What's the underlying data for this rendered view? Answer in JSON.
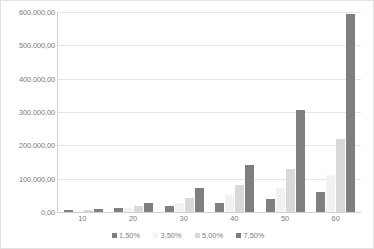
{
  "chart_data": {
    "type": "bar",
    "title": "",
    "subtitle": "",
    "xlabel": "",
    "ylabel": "",
    "grid": true,
    "legend_position": "bottom",
    "number_format": "european",
    "categories": [
      "10",
      "20",
      "30",
      "40",
      "50",
      "60"
    ],
    "ylim": [
      0,
      600000
    ],
    "ytick_values": [
      0,
      100000,
      200000,
      300000,
      400000,
      500000,
      600000
    ],
    "ytick_labels": [
      "0,00",
      "100.000,00",
      "200.000,00",
      "300.000,00",
      "400.000,00",
      "500.000,00",
      "600.000,00"
    ],
    "series": [
      {
        "name": "1,50%",
        "color": "#808080",
        "values": [
          5000,
          11000,
          19000,
          28000,
          40000,
          60000
        ]
      },
      {
        "name": "3,50%",
        "color": "#f2f2f2",
        "values": [
          4000,
          12000,
          28000,
          52000,
          72000,
          110000
        ]
      },
      {
        "name": "5,00%",
        "color": "#d9d9d9",
        "values": [
          7000,
          18000,
          42000,
          80000,
          130000,
          220000
        ]
      },
      {
        "name": "7,50%",
        "color": "#7f7f7f",
        "values": [
          8000,
          26000,
          72000,
          140000,
          305000,
          595000
        ]
      }
    ]
  },
  "legend": {
    "items": [
      {
        "label": "1,50%"
      },
      {
        "label": "3,50%"
      },
      {
        "label": "5,00%"
      },
      {
        "label": "7,50%"
      }
    ]
  },
  "colors": {
    "gridline": "#e6e6e6",
    "axis": "#d0d0d0",
    "text": "#7b7b7b",
    "background": "#ffffff",
    "border": "#e2e2e2"
  }
}
